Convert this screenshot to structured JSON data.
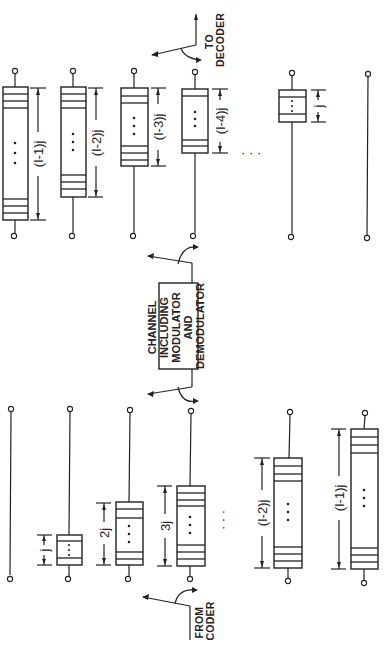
{
  "diagram": {
    "channel": {
      "lines": [
        "CHANNEL",
        "INCLUDING",
        "MODULATOR",
        "AND",
        "DEMODULATOR"
      ]
    },
    "from_coder": [
      "FROM",
      "CODER"
    ],
    "to_decoder": [
      "TO",
      "DECODER"
    ],
    "interleaver": {
      "branches": [
        {
          "delay_label": ""
        },
        {
          "delay_label": "j"
        },
        {
          "delay_label": "2j"
        },
        {
          "delay_label": "3j"
        },
        {
          "delay_label": "(I-2)j"
        },
        {
          "delay_label": "(I-1)j"
        }
      ]
    },
    "deinterleaver": {
      "branches": [
        {
          "delay_label": "(I-1)j"
        },
        {
          "delay_label": "(I-2)j"
        },
        {
          "delay_label": "(I-3)j"
        },
        {
          "delay_label": "(I-4)j"
        },
        {
          "delay_label": "j"
        },
        {
          "delay_label": ""
        }
      ]
    },
    "ellipsis": "· · ·"
  }
}
